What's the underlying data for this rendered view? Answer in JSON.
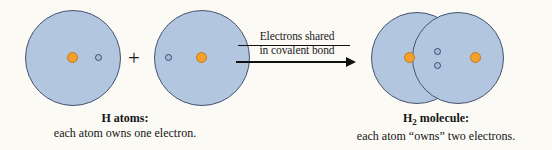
{
  "figure": {
    "background_color": "#fbfaf5",
    "operator": "+",
    "arrow": {
      "label_line1": "Electrons shared",
      "label_line2": "in covalent bond",
      "direction": "right"
    },
    "left_caption": {
      "title": "H atoms:",
      "description": "each atom owns one electron."
    },
    "right_caption": {
      "title_prefix": "H",
      "title_subscript": "2",
      "title_suffix": " molecule:",
      "description": "each atom “owns” two electrons."
    },
    "colors": {
      "shell_fill": "#b3c6e0",
      "shell_stroke": "#47536e",
      "nucleus_fill": "#f2a12c",
      "nucleus_stroke": "#c9761a",
      "electron_fill": "#aab9d4",
      "electron_stroke": "#3a4a73",
      "text": "#151515"
    },
    "atoms": [
      {
        "name": "hydrogen-atom-left",
        "electron_count": 1,
        "electron_position": "right-inner-edge"
      },
      {
        "name": "hydrogen-atom-right",
        "electron_count": 1,
        "electron_position": "left-inner-edge"
      }
    ],
    "molecule": {
      "name": "hydrogen-molecule",
      "shared_electron_count": 2,
      "shared_electron_position": "overlap-region"
    }
  }
}
